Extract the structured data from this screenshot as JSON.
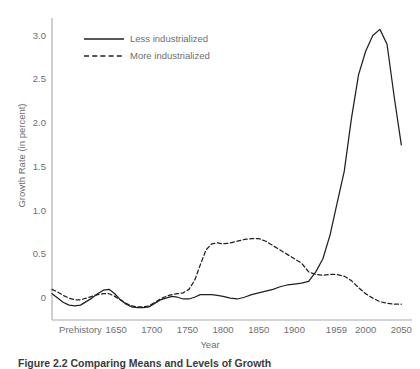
{
  "figure": {
    "caption": "Figure 2.2   Comparing Means and Levels of Growth"
  },
  "chart_data": {
    "type": "line",
    "title": "",
    "xlabel": "Year",
    "ylabel": "Growth Rate (in percent)",
    "ylim": [
      -0.25,
      3.2
    ],
    "yticks": [
      0,
      0.5,
      1.0,
      1.5,
      2.0,
      2.5,
      3.0
    ],
    "ytick_labels": [
      "0",
      "0.5",
      "1.0",
      "1.5",
      "2.0",
      "2.5",
      "3.0"
    ],
    "xtick_labels": [
      "Prehistory",
      "1650",
      "1700",
      "1750",
      "1800",
      "1850",
      "1900",
      "1959",
      "2000",
      "2050"
    ],
    "xtick_positions": [
      1600,
      1650,
      1700,
      1750,
      1800,
      1850,
      1900,
      1959,
      2000,
      2050
    ],
    "xlim": [
      1560,
      2065
    ],
    "grid": false,
    "legend_position": "top-left",
    "legend": [
      "Less industrialized",
      "More industrialized"
    ],
    "series": [
      {
        "name": "Less industrialized",
        "style": "solid",
        "color": "#231f20",
        "x": [
          1560,
          1568,
          1576,
          1584,
          1592,
          1600,
          1608,
          1616,
          1624,
          1632,
          1640,
          1648,
          1656,
          1664,
          1672,
          1680,
          1688,
          1696,
          1704,
          1712,
          1720,
          1728,
          1736,
          1744,
          1752,
          1760,
          1768,
          1776,
          1784,
          1792,
          1800,
          1810,
          1820,
          1830,
          1840,
          1850,
          1860,
          1870,
          1880,
          1890,
          1900,
          1910,
          1920,
          1930,
          1940,
          1950,
          1959,
          1970,
          1980,
          1990,
          2000,
          2010,
          2020,
          2030,
          2040,
          2050
        ],
        "y": [
          0.05,
          0.0,
          -0.05,
          -0.08,
          -0.09,
          -0.08,
          -0.04,
          0.0,
          0.05,
          0.09,
          0.1,
          0.05,
          -0.02,
          -0.07,
          -0.1,
          -0.11,
          -0.11,
          -0.1,
          -0.06,
          -0.02,
          0.0,
          0.02,
          0.01,
          -0.01,
          -0.01,
          0.01,
          0.04,
          0.04,
          0.04,
          0.03,
          0.02,
          0.0,
          -0.01,
          0.01,
          0.04,
          0.06,
          0.08,
          0.1,
          0.13,
          0.15,
          0.16,
          0.17,
          0.19,
          0.3,
          0.45,
          0.72,
          1.05,
          1.45,
          2.05,
          2.55,
          2.82,
          3.0,
          3.07,
          2.9,
          2.3,
          1.75
        ]
      },
      {
        "name": "More industrialized",
        "style": "dashed",
        "color": "#231f20",
        "x": [
          1560,
          1568,
          1576,
          1584,
          1592,
          1600,
          1608,
          1616,
          1624,
          1632,
          1640,
          1648,
          1656,
          1664,
          1672,
          1680,
          1688,
          1696,
          1704,
          1712,
          1720,
          1728,
          1736,
          1744,
          1752,
          1760,
          1768,
          1776,
          1784,
          1792,
          1800,
          1810,
          1820,
          1830,
          1840,
          1850,
          1860,
          1870,
          1880,
          1890,
          1900,
          1910,
          1920,
          1930,
          1940,
          1950,
          1959,
          1970,
          1980,
          1990,
          2000,
          2010,
          2020,
          2030,
          2040,
          2050
        ],
        "y": [
          0.1,
          0.07,
          0.03,
          0.0,
          -0.02,
          -0.02,
          0.0,
          0.02,
          0.04,
          0.05,
          0.05,
          0.02,
          -0.02,
          -0.06,
          -0.09,
          -0.1,
          -0.1,
          -0.09,
          -0.05,
          -0.01,
          0.02,
          0.04,
          0.05,
          0.06,
          0.1,
          0.2,
          0.38,
          0.55,
          0.62,
          0.63,
          0.62,
          0.63,
          0.65,
          0.67,
          0.68,
          0.68,
          0.65,
          0.6,
          0.55,
          0.5,
          0.45,
          0.4,
          0.3,
          0.27,
          0.26,
          0.27,
          0.27,
          0.25,
          0.2,
          0.12,
          0.05,
          0.0,
          -0.04,
          -0.06,
          -0.07,
          -0.07
        ]
      }
    ]
  },
  "axes": {
    "y_axis_name": "y-axis",
    "x_axis_name": "x-axis"
  }
}
